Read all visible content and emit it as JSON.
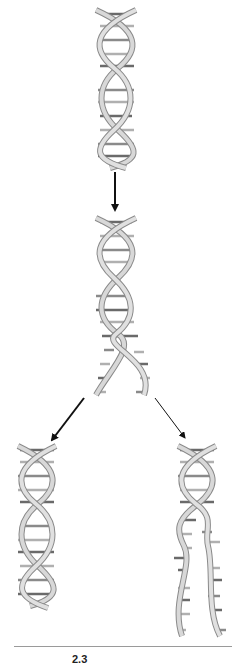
{
  "figure": {
    "panels": [
      {
        "id": "parent",
        "label": "Parent double helix"
      },
      {
        "id": "unwinding",
        "label": "Helix unwinding, strands separating"
      },
      {
        "id": "daughter-left",
        "label": "Daughter double helix (complete)"
      },
      {
        "id": "daughter-right",
        "label": "Double helix with separated strands"
      }
    ],
    "arrows": [
      {
        "from": "parent",
        "to": "unwinding",
        "style": "bold"
      },
      {
        "from": "unwinding",
        "to": "daughter-left",
        "style": "bold"
      },
      {
        "from": "unwinding",
        "to": "daughter-right",
        "style": "thin"
      }
    ],
    "colors": {
      "backbone": "#c8c8c8",
      "backbone_edge": "#8a8a8a",
      "base_light": "#b0b0b0",
      "base_dark": "#6a6a6a",
      "arrow": "#111111"
    }
  },
  "caption": {
    "number": "2.3",
    "text": "   "
  }
}
